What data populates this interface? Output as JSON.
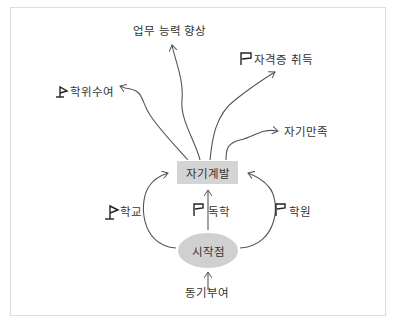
{
  "diagram": {
    "center_box": "자기계발",
    "start_node": "시작점",
    "input": "동기부여",
    "paths": [
      {
        "label": "학교",
        "flag": true
      },
      {
        "label": "독학",
        "flag": true
      },
      {
        "label": "학원",
        "flag": true
      }
    ],
    "outcomes": [
      {
        "label": "업무 능력 향상",
        "flag": false
      },
      {
        "label": "자격증 취득",
        "flag": true
      },
      {
        "label": "학위수여",
        "flag": true
      },
      {
        "label": "자기만족",
        "flag": false
      }
    ],
    "colors": {
      "box_fill": "#d4d4d4",
      "ellipse_fill": "#d0d0d0",
      "stroke": "#555555",
      "text": "#333333",
      "border": "#dcdcdc"
    }
  }
}
